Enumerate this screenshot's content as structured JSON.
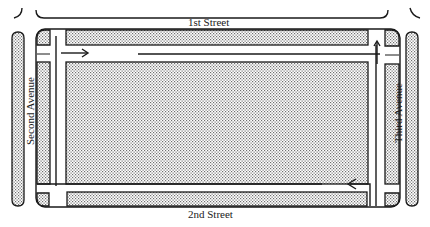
{
  "diagram": {
    "streets": {
      "top": "1st Street",
      "bottom": "2nd Street",
      "left": "Second Avenue",
      "right": "Third Avenue"
    },
    "arrows": [
      {
        "location": "top lane, near left",
        "direction": "right"
      },
      {
        "location": "right lane, near top",
        "direction": "up"
      },
      {
        "location": "bottom lane, near right",
        "direction": "left"
      }
    ],
    "colors": {
      "ink": "#1a1a1a",
      "stipple": "#8a8a8a",
      "background": "#ffffff"
    }
  }
}
